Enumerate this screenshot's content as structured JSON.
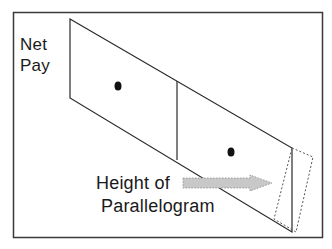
{
  "diagram": {
    "y_axis_label_line1": "Net",
    "y_axis_label_line2": "Pay",
    "annotation_line1": "Height of",
    "annotation_line2": "Parallelogram",
    "colors": {
      "stroke": "#2a2a2a",
      "frame": "#3a3a3a",
      "arrow_fill": "#c8c8c8",
      "arrow_stroke": "#8a8a8a",
      "dashed": "#555555",
      "dot": "#111111"
    },
    "elements": {
      "frame": "rectangle border",
      "parallelogram": "slanted parallelogram split by a vertical divider into two regions, each with a black dot",
      "dashed_quad": "dashed tilted quadrilateral at the right end",
      "arrow": "grey dotted-outline arrow pointing right toward the right edge"
    }
  }
}
